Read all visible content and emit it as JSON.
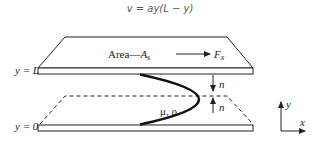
{
  "equation": "v = ay(L − y)",
  "top_plate": {
    "area_label": "Area—",
    "area_symbol": "A",
    "area_subscript": "s",
    "force_symbol": "F",
    "force_subscript": "x"
  },
  "fluid_label": "μ, ρ",
  "y_labels": {
    "top": "y = L",
    "bottom": "y = 0"
  },
  "normal_labels": {
    "top": "n",
    "bottom": "n"
  },
  "axes": {
    "x": "x",
    "y": "y"
  },
  "colors": {
    "line": "#222222",
    "plate_fill": "#ffffff",
    "background": "#ffffff"
  }
}
